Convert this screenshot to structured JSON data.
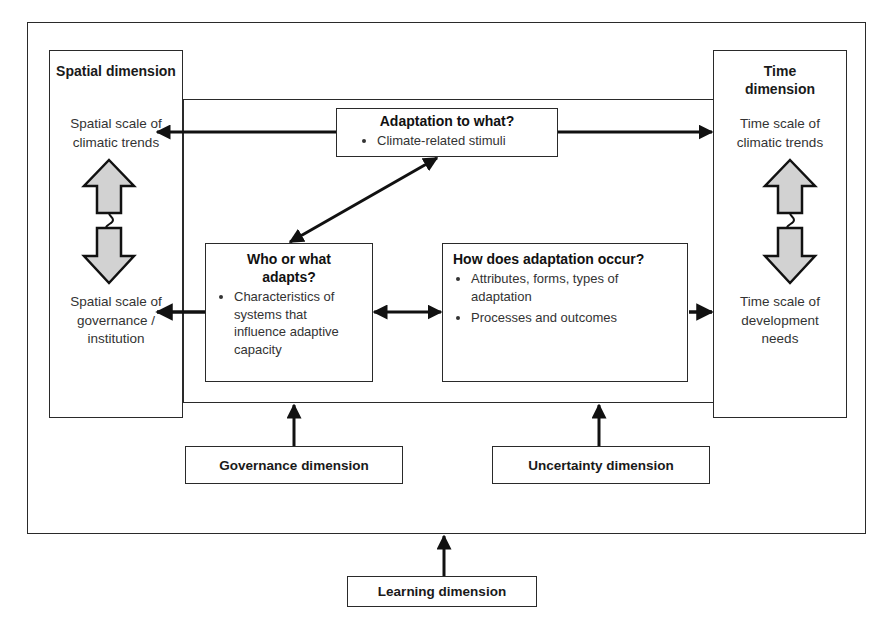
{
  "diagram": {
    "type": "conceptual-framework",
    "spatial_dimension": {
      "title": "Spatial dimension",
      "top_text": "Spatial scale of climatic trends",
      "bottom_text": "Spatial scale of governance / institution",
      "connector_symbol": "?"
    },
    "time_dimension": {
      "title": "Time dimension",
      "top_text": "Time scale of climatic trends",
      "bottom_text": "Time scale of development needs",
      "connector_symbol": "?"
    },
    "adaptation_to_what": {
      "title": "Adaptation to what?",
      "bullets": [
        "Climate-related stimuli"
      ]
    },
    "who_adapts": {
      "title": "Who or what adapts?",
      "bullets": [
        "Characteristics of systems that influence adaptive capacity"
      ]
    },
    "how_adaptation_occurs": {
      "title": "How does adaptation occur?",
      "bullets": [
        "Attributes, forms, types of adaptation",
        "Processes and outcomes"
      ]
    },
    "governance_dimension": {
      "label": "Governance dimension"
    },
    "uncertainty_dimension": {
      "label": "Uncertainty dimension"
    },
    "learning_dimension": {
      "label": "Learning dimension"
    },
    "colors": {
      "line": "#1a1a1a",
      "border": "#2a2a2a",
      "light_border": "#b8b8b8",
      "arrow_fill": "#d0d0d0",
      "text": "#333333"
    }
  }
}
